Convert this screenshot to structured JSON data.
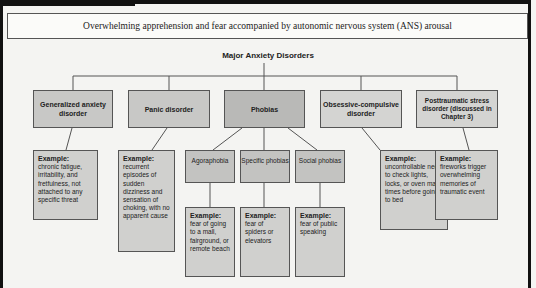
{
  "header": {
    "definition": "Overwhelming apprehension and fear accompanied by autonomic nervous system (ANS) arousal"
  },
  "diagram": {
    "title": "Major Anxiety Disorders",
    "example_label": "Example:",
    "disorders": [
      {
        "name": "Generalized anxiety disorder",
        "example": "chronic fatigue, irritability, and fretfulness, not attached to any specific threat"
      },
      {
        "name": "Panic disorder",
        "example": "recurrent episodes of sudden dizziness and sensation of choking, with no apparent cause"
      },
      {
        "name": "Phobias",
        "subtypes": [
          {
            "name": "Agoraphobia",
            "example": "fear of going to a mall, fairground, or remote beach"
          },
          {
            "name": "Specific phobias",
            "example": "fear of spiders or elevators"
          },
          {
            "name": "Social phobias",
            "example": "fear of public speaking"
          }
        ]
      },
      {
        "name": "Obsessive-compulsive disorder",
        "example": "uncontrollable need to check lights, locks, or oven many times before going to bed"
      },
      {
        "name": "Posttraumatic stress disorder (discussed in Chapter 3)",
        "example": "fireworks trigger overwhelming memories of traumatic event"
      }
    ]
  },
  "colors": {
    "frame": "#111111",
    "box_dark": "#b9b9b7",
    "box_light": "#d4d4d2",
    "line": "#555555",
    "background": "#f4f4f2"
  }
}
